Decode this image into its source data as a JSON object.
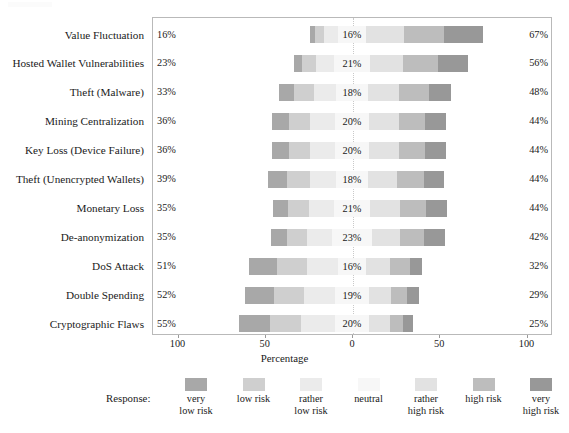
{
  "chart_data": {
    "type": "bar",
    "subtype": "diverging-stacked-likert",
    "title": "",
    "xlabel": "Percentage",
    "ylabel": "",
    "xlim": [
      -100,
      100
    ],
    "xticks": [
      "100",
      "50",
      "0",
      "50",
      "100"
    ],
    "xtick_values": [
      -100,
      -50,
      0,
      50,
      100
    ],
    "grid": false,
    "legend_position": "bottom",
    "legend_title": "Response:",
    "categories": [
      "Value Fluctuation",
      "Hosted Wallet Vulnerabilities",
      "Theft (Malware)",
      "Mining Centralization",
      "Key Loss (Device Failure)",
      "Theft (Unencrypted Wallets)",
      "Monetary Loss",
      "De-anonymization",
      "DoS Attack",
      "Double Spending",
      "Cryptographic Flaws"
    ],
    "series": [
      {
        "name": "very low risk",
        "color": "#a8a8a8",
        "values": [
          3,
          5,
          9,
          10,
          10,
          11,
          9,
          9,
          16,
          17,
          18
        ]
      },
      {
        "name": "low risk",
        "color": "#cfcfcf",
        "values": [
          5,
          8,
          11,
          12,
          12,
          13,
          12,
          12,
          17,
          17,
          18
        ]
      },
      {
        "name": "rather low risk",
        "color": "#ebebeb",
        "values": [
          8,
          10,
          13,
          14,
          14,
          15,
          14,
          14,
          18,
          18,
          19
        ]
      },
      {
        "name": "neutral",
        "color": "#f7f7f7",
        "values": [
          16,
          21,
          18,
          20,
          20,
          18,
          21,
          23,
          16,
          19,
          20
        ]
      },
      {
        "name": "rather high risk",
        "color": "#e2e2e2",
        "values": [
          22,
          19,
          18,
          17,
          17,
          17,
          17,
          16,
          14,
          13,
          12
        ]
      },
      {
        "name": "high risk",
        "color": "#bdbdbd",
        "values": [
          23,
          20,
          17,
          15,
          15,
          15,
          15,
          14,
          11,
          9,
          7
        ]
      },
      {
        "name": "very high risk",
        "color": "#989898",
        "values": [
          22,
          17,
          13,
          12,
          12,
          12,
          12,
          12,
          7,
          7,
          6
        ]
      }
    ],
    "left_totals": [
      "16%",
      "23%",
      "33%",
      "36%",
      "36%",
      "39%",
      "35%",
      "35%",
      "51%",
      "52%",
      "55%"
    ],
    "neutral_labels": [
      "16%",
      "21%",
      "18%",
      "20%",
      "20%",
      "18%",
      "21%",
      "23%",
      "16%",
      "19%",
      "20%"
    ],
    "right_totals": [
      "67%",
      "56%",
      "48%",
      "44%",
      "44%",
      "44%",
      "44%",
      "42%",
      "32%",
      "29%",
      "25%"
    ]
  },
  "legend": {
    "title": "Response:",
    "items": [
      {
        "label": "very\nlow risk",
        "color": "#a8a8a8"
      },
      {
        "label": "low risk",
        "color": "#cfcfcf"
      },
      {
        "label": "rather\nlow risk",
        "color": "#ebebeb"
      },
      {
        "label": "neutral",
        "color": "#f7f7f7"
      },
      {
        "label": "rather\nhigh risk",
        "color": "#e2e2e2"
      },
      {
        "label": "high risk",
        "color": "#bdbdbd"
      },
      {
        "label": "very\nhigh risk",
        "color": "#989898"
      }
    ]
  },
  "axis": {
    "title": "Percentage",
    "ticks": [
      "100",
      "50",
      "0",
      "50",
      "100"
    ]
  }
}
